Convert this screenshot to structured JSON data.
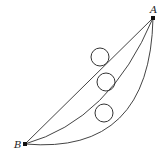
{
  "diagram": {
    "type": "brachistochrone-paths",
    "points": [
      {
        "id": "A",
        "label": "A",
        "x": 153,
        "y": 18,
        "label_x": 150,
        "label_y": 13
      },
      {
        "id": "B",
        "label": "B",
        "x": 25,
        "y": 144,
        "label_x": 14,
        "label_y": 148
      }
    ],
    "paths": [
      {
        "name": "straight-path",
        "d": "M25,144 L153,18"
      },
      {
        "name": "middle-curve-path",
        "d": "M25,144 Q110,120 153,18"
      },
      {
        "name": "lower-curve-path",
        "d": "M25,144 Q150,155 153,18"
      }
    ],
    "balls": [
      {
        "name": "ball-on-straight-path",
        "cx": 100,
        "cy": 57,
        "r": 9
      },
      {
        "name": "ball-on-middle-curve",
        "cx": 106,
        "cy": 82,
        "r": 9
      },
      {
        "name": "ball-on-lower-curve",
        "cx": 104,
        "cy": 113,
        "r": 9
      }
    ],
    "colors": {
      "stroke": "#444444",
      "point": "#111111",
      "background": "#ffffff"
    }
  }
}
